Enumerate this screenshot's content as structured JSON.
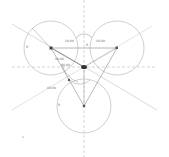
{
  "drawing": {
    "circles": [
      {
        "id": "top-left",
        "cx": 51,
        "cy": 48,
        "r": 27,
        "radius_label": "R"
      },
      {
        "id": "top-right",
        "cx": 117,
        "cy": 48,
        "r": 27,
        "radius_label": "R"
      },
      {
        "id": "bottom",
        "cx": 84,
        "cy": 106,
        "r": 27,
        "radius_label": "R"
      }
    ],
    "center_point": {
      "cx": 84,
      "cy": 67
    },
    "angle_labels": [
      {
        "text": "60.00",
        "x": 65,
        "y": 40
      },
      {
        "text": "60.00",
        "x": 96,
        "y": 40
      },
      {
        "text": "60.00",
        "x": 55,
        "y": 58
      },
      {
        "text": "60.00",
        "x": 61,
        "y": 64
      },
      {
        "text": "60.00",
        "x": 47,
        "y": 87
      }
    ],
    "small_labels": [
      {
        "text": "R",
        "x": 26,
        "y": 46
      },
      {
        "text": "R",
        "x": 58,
        "y": 104
      },
      {
        "text": "R",
        "x": 86,
        "y": 44
      },
      {
        "text": "x",
        "x": 22,
        "y": 136
      }
    ],
    "colors": {
      "circle_stroke": "#b0b0b0",
      "line_stroke": "#9a9a9a",
      "center_line": "#a8a8a8",
      "point_fill": "#444444"
    }
  }
}
